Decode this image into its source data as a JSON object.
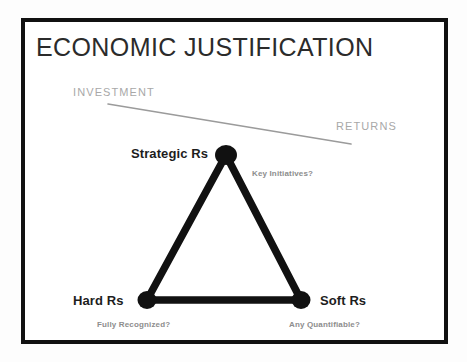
{
  "slide": {
    "title": "ECONOMIC JUSTIFICATION",
    "background_color": "#fdfdfd",
    "frame_color": "#111111",
    "canvas_color": "#ffffff"
  },
  "axis": {
    "investment_label": "INVESTMENT",
    "returns_label": "RETURNS",
    "line_color": "#9b9b9b",
    "text_color": "#a8a8a8"
  },
  "diagram": {
    "type": "triangle",
    "node_color": "#111111",
    "edge_color": "#111111",
    "nodes": [
      {
        "id": "strategic",
        "label": "Strategic Rs",
        "caption": "Key Initiatives?",
        "x": 226,
        "y": 155
      },
      {
        "id": "hard",
        "label": "Hard Rs",
        "caption": "Fully Recognized?",
        "x": 147,
        "y": 300
      },
      {
        "id": "soft",
        "label": "Soft Rs",
        "caption": "Any Quantifiable?",
        "x": 301,
        "y": 300
      }
    ],
    "edges": [
      {
        "from": "strategic",
        "to": "hard"
      },
      {
        "from": "strategic",
        "to": "soft"
      },
      {
        "from": "hard",
        "to": "soft"
      }
    ]
  }
}
